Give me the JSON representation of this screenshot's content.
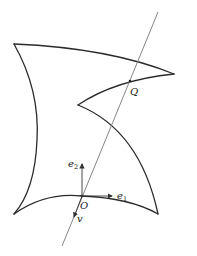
{
  "figure": {
    "labels": {
      "Q": "Q",
      "O": "O",
      "e1_base": "e",
      "e1_sub": "1",
      "e2_base": "e",
      "e2_sub": "2",
      "v": "v"
    },
    "points": {
      "O": [
        82,
        196
      ],
      "Q": [
        130,
        81
      ],
      "top_left": [
        14,
        44
      ],
      "bottom_left": [
        14,
        214
      ],
      "bottom_right": [
        158,
        214
      ],
      "right_tip": [
        174,
        74
      ],
      "inner_cusp": [
        78,
        105
      ]
    },
    "line": {
      "from": [
        158,
        12
      ],
      "to": [
        62,
        246
      ]
    },
    "colors": {
      "curve": "#2a2a2a",
      "line": "#777777"
    }
  }
}
